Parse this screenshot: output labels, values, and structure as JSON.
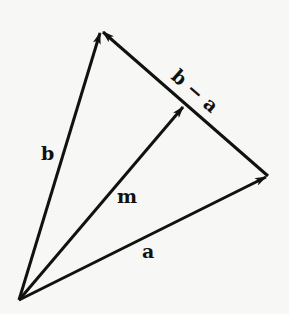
{
  "diagram": {
    "title": "",
    "type": "vector-diagram",
    "points": {
      "O": {
        "x": 19,
        "y": 300
      },
      "A": {
        "x": 268,
        "y": 176
      },
      "B": {
        "x": 101,
        "y": 31
      },
      "M": {
        "x": 184,
        "y": 105
      }
    },
    "vectors": [
      {
        "id": "a",
        "label": "a",
        "from": "O",
        "to": "A"
      },
      {
        "id": "b",
        "label": "b",
        "from": "O",
        "to": "B"
      },
      {
        "id": "m",
        "label": "m",
        "from": "O",
        "to": "M"
      },
      {
        "id": "b_minus_a",
        "label": "b − a",
        "from": "A",
        "to": "B"
      }
    ],
    "labels": {
      "a": "a",
      "b": "b",
      "m": "m",
      "b_minus_a": "b − a"
    },
    "colors": {
      "stroke": "#111111",
      "background": "#f7f7f5"
    }
  }
}
